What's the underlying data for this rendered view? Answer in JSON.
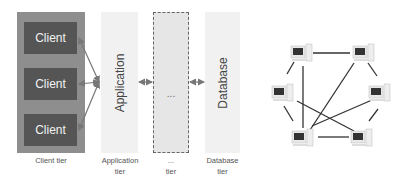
{
  "multi_tier": {
    "client_boxes": [
      "Client",
      "Client",
      "Client"
    ],
    "columns": {
      "application": "Application",
      "middle": "...",
      "database": "Database"
    },
    "captions": {
      "client_tier": "Client tier",
      "application_tier_line1": "Application",
      "application_tier_line2": "tier",
      "middle_tier_line1": "...",
      "middle_tier_line2": "tier",
      "database_tier_line1": "Database",
      "database_tier_line2": "tier"
    },
    "colors": {
      "client_tier_bg": "#8e8e8e",
      "client_box": "#555555",
      "tier_column": "#f1f1f1",
      "middle_column": "#e6e6e6",
      "arrow": "#777777"
    }
  },
  "peer_network": {
    "nodes": [
      {
        "id": "n1",
        "x": 300,
        "y": 53
      },
      {
        "id": "n2",
        "x": 362,
        "y": 53
      },
      {
        "id": "n3",
        "x": 283,
        "y": 96
      },
      {
        "id": "n4",
        "x": 378,
        "y": 96
      },
      {
        "id": "n5",
        "x": 300,
        "y": 140
      },
      {
        "id": "n6",
        "x": 362,
        "y": 140
      }
    ],
    "edges": [
      [
        "n1",
        "n2"
      ],
      [
        "n1",
        "n3"
      ],
      [
        "n1",
        "n5"
      ],
      [
        "n2",
        "n4"
      ],
      [
        "n2",
        "n5"
      ],
      [
        "n3",
        "n5"
      ],
      [
        "n3",
        "n6"
      ],
      [
        "n4",
        "n5"
      ],
      [
        "n4",
        "n6"
      ],
      [
        "n5",
        "n6"
      ]
    ]
  }
}
